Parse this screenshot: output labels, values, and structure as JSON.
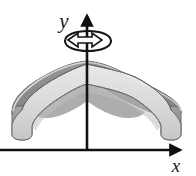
{
  "figure": {
    "kind": "math-diagram",
    "canvas": {
      "width": 196,
      "height": 176,
      "background": "#ffffff"
    }
  },
  "axes": {
    "x": {
      "label": "x",
      "label_position": {
        "x": 175,
        "y": 171
      },
      "line": {
        "x1": 0,
        "y1": 150,
        "x2": 178,
        "y2": 150
      },
      "arrow_tip": {
        "x": 190,
        "y": 150
      },
      "color": "#111111",
      "stroke_width": 2.4
    },
    "y": {
      "label": "y",
      "label_position": {
        "x": 64,
        "y": 28
      },
      "line": {
        "x1": 87,
        "y1": 150,
        "x2": 87,
        "y2": 22
      },
      "arrow_tip": {
        "x": 87,
        "y": 10
      },
      "color": "#111111",
      "stroke_width": 2.4
    }
  },
  "rotation_indicator": {
    "name": "revolution-arrow",
    "shape": "ellipse-with-arrowhead",
    "center": {
      "x": 88,
      "y": 41
    },
    "radius_x": 23,
    "radius_y": 9,
    "direction": "counterclockwise-viewed-from-above",
    "arrowhead_points_to": "right",
    "stroke": "#151515",
    "fill": "#ffffff",
    "stroke_width": 2.0
  },
  "solid": {
    "name": "bell-shaped-surface-of-revolution",
    "apex": {
      "x": 87,
      "y": 61
    },
    "left_extent": {
      "x": 12,
      "y": 110
    },
    "right_extent": {
      "x": 181,
      "y": 110
    },
    "base_bottom": {
      "y": 141
    },
    "rim_front_low": {
      "y": 126
    },
    "outline_stroke": "#5a5a5a",
    "outline_stroke_width": 1.0,
    "colors": {
      "back_surface_dark": "#8f8f8f",
      "back_surface_mid": "#9e9e9e",
      "front_band_light": "#d9d9d9",
      "front_band_highlight": "#e6e6e6",
      "end_cap": "#a8a8a8",
      "end_cap_shadow": "#949494",
      "underside": "#b5b5b5",
      "outline": "#5a5a5a"
    }
  }
}
